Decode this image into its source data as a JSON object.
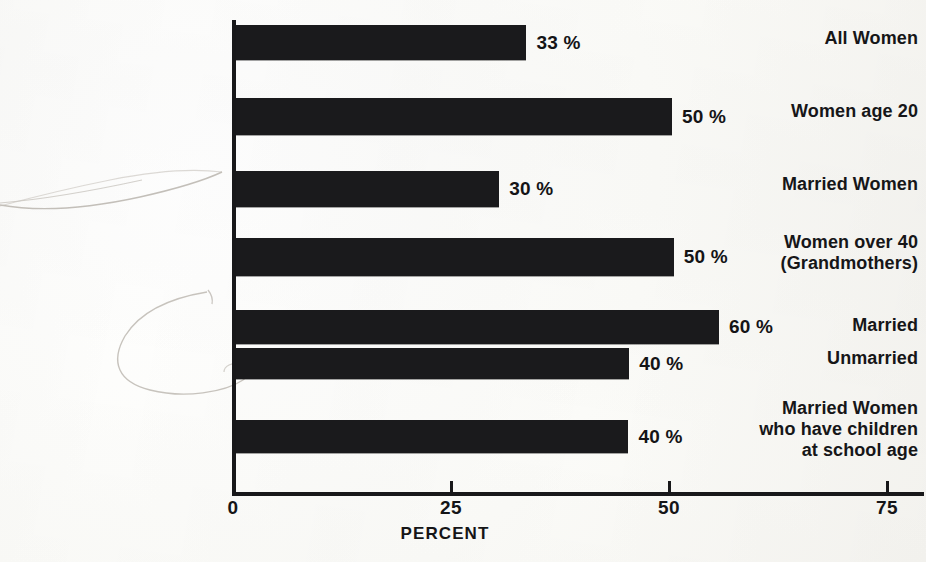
{
  "chart_data": {
    "type": "bar",
    "orientation": "horizontal",
    "title": "",
    "xlabel": "PERCENT",
    "ylabel": "",
    "xlim": [
      0,
      75
    ],
    "xticks": [
      "0",
      "25",
      "50",
      "75"
    ],
    "xtick_values": [
      0,
      25,
      50,
      75
    ],
    "grid": false,
    "legend": "none",
    "categories": [
      "All Women",
      "Women age 20",
      "Married Women",
      "Women over 40\n(Grandmothers)",
      "Married",
      "Unmarried",
      "Married Women\nwho have children\nat school age"
    ],
    "values": [
      33,
      50,
      30,
      50,
      60,
      40,
      40
    ],
    "drawn_values": [
      33.3,
      50.0,
      30.2,
      50.2,
      55.4,
      45.1,
      45.0
    ],
    "value_labels": [
      "33 %",
      "50 %",
      "30 %",
      "50 %",
      "60 %",
      "40 %",
      "40 %"
    ],
    "bar_color": "#1a1a1c",
    "background_color": "#fbfaf7",
    "text_color": "#151517"
  },
  "axis": {
    "ticks": [
      {
        "label": "0",
        "value": 0
      },
      {
        "label": "25",
        "value": 25
      },
      {
        "label": "50",
        "value": 50
      },
      {
        "label": "75",
        "value": 75
      }
    ],
    "title": "PERCENT"
  },
  "bars": [
    {
      "label": "All Women",
      "value_label": "33 %",
      "value": 33,
      "drawn": 33.3,
      "top": 25,
      "height": 35
    },
    {
      "label": "Women age 20",
      "value_label": "50 %",
      "value": 50,
      "drawn": 50.0,
      "top": 98,
      "height": 37
    },
    {
      "label": "Married Women",
      "value_label": "30 %",
      "value": 30,
      "drawn": 30.2,
      "top": 171,
      "height": 36
    },
    {
      "label": "Women over 40\n(Grandmothers)",
      "value_label": "50 %",
      "value": 50,
      "drawn": 50.2,
      "top": 238,
      "height": 38
    },
    {
      "label": "Married",
      "value_label": "60 %",
      "value": 60,
      "drawn": 55.4,
      "top": 310,
      "height": 34
    },
    {
      "label": "Unmarried",
      "value_label": "40 %",
      "value": 40,
      "drawn": 45.1,
      "top": 348,
      "height": 31
    },
    {
      "label": "Married Women\nwho have children\nat school age",
      "value_label": "40 %",
      "value": 40,
      "drawn": 45.0,
      "top": 420,
      "height": 33
    }
  ],
  "labels": [
    {
      "text": "All Women",
      "top": 28,
      "name": "category-label-all-women"
    },
    {
      "text": "Women age 20",
      "top": 101,
      "name": "category-label-women-age-20"
    },
    {
      "text": "Married Women",
      "top": 174,
      "name": "category-label-married-women"
    },
    {
      "text": "Women over 40\n(Grandmothers)",
      "top": 232,
      "name": "category-label-women-over-40"
    },
    {
      "text": "Married",
      "top": 315,
      "name": "category-label-married"
    },
    {
      "text": "Unmarried",
      "top": 348,
      "name": "category-label-unmarried"
    },
    {
      "text": "Married Women\nwho have children\nat school age",
      "top": 398,
      "name": "category-label-married-women-children"
    }
  ]
}
